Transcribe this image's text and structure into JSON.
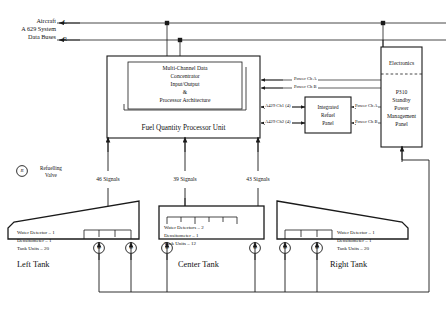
{
  "buses": {
    "caption_line1": "Aircraft",
    "caption_line2": "A 629 System",
    "caption_line3": "Data Buses",
    "left_id": "L",
    "right_id": "R"
  },
  "processor": {
    "inner_line1": "Multi-Channel Data",
    "inner_line2": "Concentrator",
    "inner_line3": "Input/Output",
    "inner_line4": "&",
    "inner_line5": "Processor Architecture",
    "title": "Fuel Quantity Processor Unit"
  },
  "channels": {
    "ch1": "A429 Ch1 (4)",
    "ch2": "A429 Ch2 (4)"
  },
  "power": {
    "upper_a": "Power Ch A",
    "upper_b": "Power Ch B",
    "panel_a": "Power Ch A",
    "panel_b": "Power Ch B"
  },
  "refuel_panel": {
    "line1": "Integrated",
    "line2": "Refuel",
    "line3": "Panel"
  },
  "standby_panel": {
    "electronics": "Electronics",
    "line1": "P310",
    "line2": "Standby",
    "line3": "Power",
    "line4": "Management",
    "line5": "Panel"
  },
  "legend": {
    "valve_mark": "R",
    "line1": "Refuelling",
    "line2": "Valve"
  },
  "signals": [
    {
      "label": "46 Signals"
    },
    {
      "label": "39 Signals"
    },
    {
      "label": "43 Signals"
    }
  ],
  "tanks": [
    {
      "name": "Left Tank",
      "detail1": "Water Detector – 1",
      "detail2": "Densitometer – 1",
      "detail3": "Tank Units – 20",
      "valve_mark": "R"
    },
    {
      "name": "Center Tank",
      "detail1": "Water Detectors – 2",
      "detail2": "Densitometer – 1",
      "detail3": "Tank Units – 12",
      "valve_mark": "R"
    },
    {
      "name": "Right Tank",
      "detail1": "Water Detector – 1",
      "detail2": "Densitometer – 1",
      "detail3": "Tank Units – 20",
      "valve_mark": "R"
    }
  ],
  "colors": {
    "line": "#1a1a1a",
    "thin": "#4a4a4a",
    "background": "#ffffff"
  }
}
